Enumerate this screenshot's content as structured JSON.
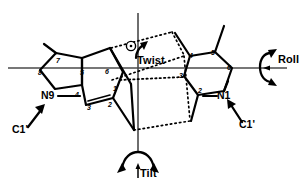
{
  "figure": {
    "type": "chemical-structure-diagram",
    "colors": {
      "stroke": "#000000",
      "background": "#ffffff",
      "axis": "#3a3a3a",
      "hbond": "#000000"
    },
    "axes": {
      "horizontal_label": "Roll",
      "vertical_label": "Tilt",
      "normal_label": "Twist"
    }
  },
  "labels": {
    "twist": "Twist",
    "roll": "Roll",
    "tilt": "Tilt"
  },
  "purine": {
    "name": "purine-base",
    "glycosidic_nitrogen": "N9",
    "sugar_attachment": "C1'",
    "ring_numbers": [
      "7",
      "8",
      "5",
      "4",
      "6",
      "1",
      "2",
      "3"
    ]
  },
  "pyrimidine": {
    "name": "pyrimidine-base",
    "glycosidic_nitrogen": "N1",
    "sugar_attachment": "C1'",
    "ring_numbers": [
      "4",
      "5",
      "3",
      "6",
      "2"
    ]
  },
  "atom_labels": {
    "n9": "N9",
    "n1": "N1",
    "c1prime_left": "C1'",
    "c1prime_right": "C1'"
  },
  "purine_numbers": {
    "p7": "7",
    "p8": "8",
    "p5": "5",
    "p4": "4",
    "p6": "6",
    "p1": "1",
    "p2": "2",
    "p3": "3"
  },
  "pyrimidine_numbers": {
    "y4": "4",
    "y5": "5",
    "y3": "3",
    "y6": "6",
    "y2": "2"
  }
}
